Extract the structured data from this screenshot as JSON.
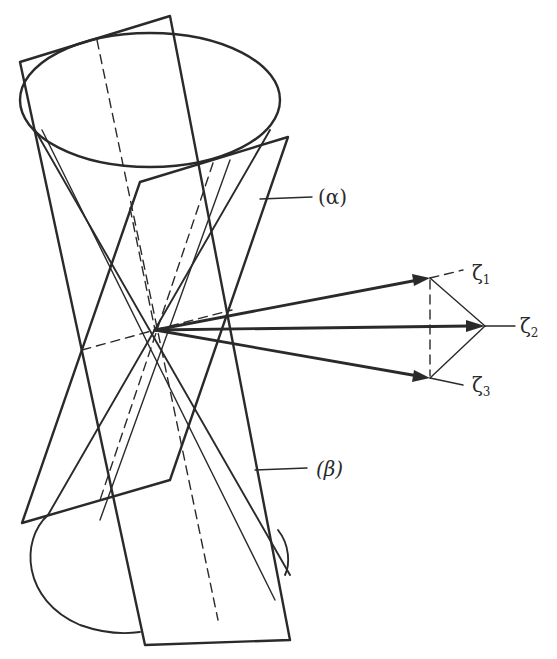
{
  "figure": {
    "labels": {
      "alpha": "(α)",
      "beta": "(β)",
      "zeta1": "ζ",
      "zeta1_sub": "1",
      "zeta2": "ζ",
      "zeta2_sub": "2",
      "zeta3": "ζ",
      "zeta3_sub": "3"
    },
    "colors": {
      "ink": "#2a2a2a",
      "background": "#ffffff"
    },
    "geometry": {
      "apex": [
        155,
        330
      ],
      "top_ellipse": {
        "cx": 150,
        "cy": 100,
        "rx": 130,
        "ry": 68
      },
      "vector_tips": {
        "zeta1": [
          430,
          278
        ],
        "zeta2": [
          485,
          326
        ],
        "zeta3": [
          430,
          378
        ]
      }
    }
  }
}
